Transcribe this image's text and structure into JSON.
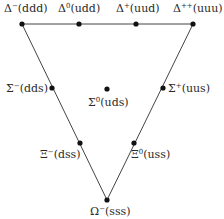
{
  "diagram": {
    "vertices": {
      "top_left": [
        22,
        24
      ],
      "top_right": [
        193,
        24
      ],
      "bottom": [
        107,
        200
      ]
    },
    "particles": [
      {
        "id": "delta-minus",
        "symbol": "Δ",
        "charge": "−",
        "quarks": "ddd",
        "x": 22,
        "y": 24,
        "label_x": 4,
        "label_y": 12,
        "anchor": "start"
      },
      {
        "id": "delta-zero",
        "symbol": "Δ",
        "charge": "0",
        "quarks": "udd",
        "x": 79,
        "y": 24,
        "label_x": 58,
        "label_y": 12,
        "anchor": "start"
      },
      {
        "id": "delta-plus",
        "symbol": "Δ",
        "charge": "+",
        "quarks": "uud",
        "x": 136,
        "y": 24,
        "label_x": 116,
        "label_y": 12,
        "anchor": "start"
      },
      {
        "id": "delta-plus-plus",
        "symbol": "Δ",
        "charge": "++",
        "quarks": "uuu",
        "x": 193,
        "y": 24,
        "label_x": 173,
        "label_y": 12,
        "anchor": "start"
      },
      {
        "id": "sigma-minus",
        "symbol": "Σ",
        "charge": "−",
        "quarks": "dds",
        "x": 52,
        "y": 88,
        "label_x": 6,
        "label_y": 92,
        "anchor": "start"
      },
      {
        "id": "sigma-zero",
        "symbol": "Σ",
        "charge": "0",
        "quarks": "uds",
        "x": 107,
        "y": 89,
        "label_x": 88,
        "label_y": 106,
        "anchor": "start"
      },
      {
        "id": "sigma-plus",
        "symbol": "Σ",
        "charge": "+",
        "quarks": "uus",
        "x": 163,
        "y": 88,
        "label_x": 168,
        "label_y": 92,
        "anchor": "start"
      },
      {
        "id": "xi-minus",
        "symbol": "Ξ",
        "charge": "−",
        "quarks": "dss",
        "x": 80,
        "y": 143,
        "label_x": 40,
        "label_y": 158,
        "anchor": "start"
      },
      {
        "id": "xi-zero",
        "symbol": "Ξ",
        "charge": "0",
        "quarks": "uss",
        "x": 134,
        "y": 143,
        "label_x": 131,
        "label_y": 158,
        "anchor": "start"
      },
      {
        "id": "omega-minus",
        "symbol": "Ω",
        "charge": "−",
        "quarks": "sss",
        "x": 107,
        "y": 200,
        "label_x": 90,
        "label_y": 215,
        "anchor": "start"
      }
    ],
    "colors": {
      "line": "#444444",
      "node": "#111111",
      "text": "#2a2a2a"
    }
  }
}
